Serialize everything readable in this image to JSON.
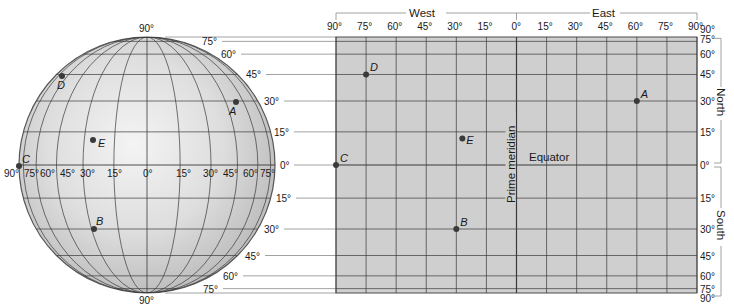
{
  "diagram": {
    "type": "latitude-longitude-figure",
    "colors": {
      "globe_fill_light": "#f4f4f4",
      "globe_fill_dark": "#b9b9b9",
      "map_fill": "#cfcfcf",
      "grid_line": "#3a3a3a",
      "guide_line": "#8a8a8a",
      "point": "#3a3a3a",
      "text": "#1a1a1a"
    },
    "globe": {
      "cx": 147,
      "cy": 165,
      "r": 128,
      "meridians_deg": [
        15,
        30,
        45,
        60,
        75
      ],
      "parallels_deg": [
        15,
        30,
        45,
        60,
        75
      ],
      "top_label": "90°",
      "bottom_label": "90°",
      "equator_labels": [
        {
          "text": "90°",
          "x": 4
        },
        {
          "text": "75°",
          "x": 24
        },
        {
          "text": "60°",
          "x": 40
        },
        {
          "text": "45°",
          "x": 60
        },
        {
          "text": "30°",
          "x": 80
        },
        {
          "text": "15°",
          "x": 107
        },
        {
          "text": "0°",
          "x": 143
        },
        {
          "text": "15°",
          "x": 176
        },
        {
          "text": "30°",
          "x": 203
        },
        {
          "text": "45°",
          "x": 223
        },
        {
          "text": "60°",
          "x": 243
        },
        {
          "text": "75°",
          "x": 260
        }
      ],
      "lat_labels_north": [
        {
          "text": "75°",
          "lat": 75,
          "x": 202
        },
        {
          "text": "60°",
          "lat": 60,
          "x": 221
        },
        {
          "text": "45°",
          "lat": 45,
          "x": 246
        },
        {
          "text": "30°",
          "lat": 30,
          "x": 264
        },
        {
          "text": "15°",
          "lat": 15,
          "x": 274
        },
        {
          "text": "0°",
          "lat": 0,
          "x": 280
        }
      ],
      "lat_labels_south": [
        {
          "text": "15°",
          "lat": -15,
          "x": 276
        },
        {
          "text": "30°",
          "lat": -30,
          "x": 264
        },
        {
          "text": "45°",
          "lat": -45,
          "x": 245
        },
        {
          "text": "60°",
          "lat": -60,
          "x": 223
        },
        {
          "text": "75°",
          "lat": -75,
          "x": 203
        }
      ],
      "points": [
        {
          "label": "D",
          "x": 62,
          "y": 76,
          "lx": 57,
          "ly": 89
        },
        {
          "label": "A",
          "x": 236,
          "y": 102,
          "lx": 229,
          "ly": 115
        },
        {
          "label": "E",
          "x": 93,
          "y": 140,
          "lx": 98,
          "ly": 147
        },
        {
          "label": "C",
          "x": 19,
          "y": 166,
          "lx": 22,
          "ly": 163
        },
        {
          "label": "B",
          "x": 94,
          "y": 229,
          "lx": 96,
          "ly": 225
        }
      ]
    },
    "map": {
      "left": 336,
      "right": 697,
      "top": 37,
      "bottom": 293,
      "prime_x": 516.5,
      "equator_y": 165,
      "r": 128,
      "lon_step_deg": 15,
      "lat_lines_deg": [
        75,
        60,
        45,
        30,
        15,
        0,
        -15,
        -30,
        -45,
        -60,
        -75
      ],
      "lon_labels": [
        "90°",
        "75°",
        "60°",
        "45°",
        "30°",
        "15°",
        "0°",
        "15°",
        "30°",
        "45°",
        "60°",
        "75°",
        "90°"
      ],
      "west_label": "West",
      "east_label": "East",
      "north_label": "North",
      "south_label": "South",
      "right_lat_labels": [
        {
          "text": "90°",
          "lat": 90
        },
        {
          "text": "75°",
          "lat": 75
        },
        {
          "text": "60°",
          "lat": 60
        },
        {
          "text": "45°",
          "lat": 45
        },
        {
          "text": "30°",
          "lat": 30
        },
        {
          "text": "15°",
          "lat": 15
        },
        {
          "text": "0°",
          "lat": 0
        },
        {
          "text": "15°",
          "lat": -15
        },
        {
          "text": "30°",
          "lat": -30
        },
        {
          "text": "45°",
          "lat": -45
        },
        {
          "text": "60°",
          "lat": -60
        },
        {
          "text": "75°",
          "lat": -75
        },
        {
          "text": "90°",
          "lat": -90
        }
      ],
      "prime_meridian_label": "Prime meridian",
      "equator_label": "Equator",
      "points": [
        {
          "label": "D",
          "lon": -75,
          "lat": 45
        },
        {
          "label": "A",
          "lon": 60,
          "lat": 30
        },
        {
          "label": "E",
          "lon": -27,
          "lat": 12
        },
        {
          "label": "C",
          "lon": -90,
          "lat": 0
        },
        {
          "label": "B",
          "lon": -30,
          "lat": -30
        }
      ]
    }
  }
}
